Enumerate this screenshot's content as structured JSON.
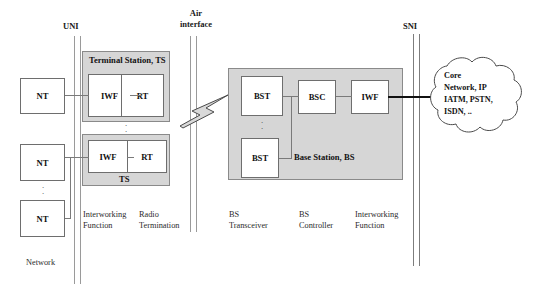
{
  "diagram": {
    "interfaces": [
      {
        "id": "uni",
        "label": "UNI"
      },
      {
        "id": "air",
        "label": "Air\ninterface",
        "line1": "Air",
        "line2": "interface"
      },
      {
        "id": "sni",
        "label": "SNI"
      }
    ],
    "network_label": "Network",
    "terminals": [
      {
        "label": "NT"
      },
      {
        "label": "NT"
      },
      {
        "label": "NT"
      }
    ],
    "terminal_stations": [
      {
        "title": "Terminal Station, TS",
        "title_position": "top",
        "blocks": [
          {
            "label": "IWF"
          },
          {
            "label": "RT"
          }
        ]
      },
      {
        "title": "TS",
        "title_position": "bottom",
        "blocks": [
          {
            "label": "IWF"
          },
          {
            "label": "RT"
          }
        ]
      }
    ],
    "ts_legend": [
      {
        "line1": "Interworking",
        "line2": "Function"
      },
      {
        "line1": "Radio",
        "line2": "Termination"
      }
    ],
    "base_station": {
      "title": "Base Station, BS",
      "blocks": [
        {
          "label": "BST"
        },
        {
          "label": "BSC"
        },
        {
          "label": "IWF"
        },
        {
          "label": "BST"
        }
      ]
    },
    "bs_legend": [
      {
        "line1": "BS",
        "line2": "Transceiver"
      },
      {
        "line1": "BS",
        "line2": "Controller"
      },
      {
        "line1": "Interworking",
        "line2": "Function"
      }
    ],
    "cloud": {
      "lines": [
        "Core",
        "Network, IP",
        "IATM, PSTN,",
        "ISDN, .."
      ]
    },
    "ellipsis": "·\n·",
    "colors": {
      "container_fill": "#d6d6d6",
      "container_stroke": "#8a8a8a",
      "box_fill": "#ffffff",
      "box_stroke": "#6e6e6e",
      "line": "#7a7a7a",
      "thick_line": "#111111",
      "interface_line": "#9a9a9a",
      "text": "#111111"
    }
  }
}
